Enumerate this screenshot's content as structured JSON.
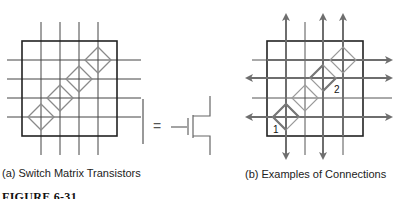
{
  "figure": {
    "title": "FIGURE 6-31",
    "panels": [
      {
        "id": "a",
        "caption": "(a) Switch Matrix Transistors",
        "symbol_equals": "="
      },
      {
        "id": "b",
        "caption": "(b) Examples of Connections",
        "connection_labels": [
          "1",
          "2"
        ]
      }
    ]
  },
  "colors": {
    "grid": "#333333",
    "box": "#222222",
    "diamond": "#8a8a8a",
    "arrow": "#6e6e6e",
    "connection": "#777777"
  }
}
